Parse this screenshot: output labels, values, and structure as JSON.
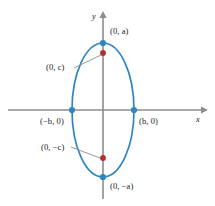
{
  "figure": {
    "axes": {
      "x_label": "x",
      "y_label": "y",
      "axis_color": "#8c8c8c",
      "origin": [
        103,
        110
      ]
    },
    "curve": {
      "shape": "ellipse",
      "stroke_color": "#2e86c1",
      "semi_axis_horizontal_b": 31,
      "semi_axis_vertical_a": 67,
      "orientation": "vertical"
    },
    "vertex_color": "#2e86c1",
    "focus_color": "#b03030",
    "points": [
      {
        "name": "top-vertex",
        "label": "(0, a)",
        "kind": "vertex",
        "cx": 103,
        "cy": 43,
        "label_x": 110,
        "label_y": 27
      },
      {
        "name": "bottom-vertex",
        "label": "(0, −a)",
        "kind": "vertex",
        "cx": 103,
        "cy": 177,
        "label_x": 110,
        "label_y": 182
      },
      {
        "name": "left-vertex",
        "label": "(−b, 0)",
        "kind": "vertex",
        "cx": 72,
        "cy": 110,
        "label_x": 40,
        "label_y": 117
      },
      {
        "name": "right-vertex",
        "label": "(b, 0)",
        "kind": "vertex",
        "cx": 134,
        "cy": 110,
        "label_x": 139,
        "label_y": 117
      },
      {
        "name": "upper-focus",
        "label": "(0, c)",
        "kind": "focus",
        "cx": 103,
        "cy": 53,
        "label_x": 46,
        "label_y": 63
      },
      {
        "name": "lower-focus",
        "label": "(0, −c)",
        "kind": "focus",
        "cx": 103,
        "cy": 158,
        "label_x": 41,
        "label_y": 143
      }
    ],
    "leader_lines": [
      {
        "name": "leader-upper-focus",
        "x1": 74,
        "y1": 68,
        "x2": 101,
        "y2": 55
      },
      {
        "name": "leader-lower-focus",
        "x1": 71,
        "y1": 147,
        "x2": 100,
        "y2": 158
      }
    ]
  }
}
